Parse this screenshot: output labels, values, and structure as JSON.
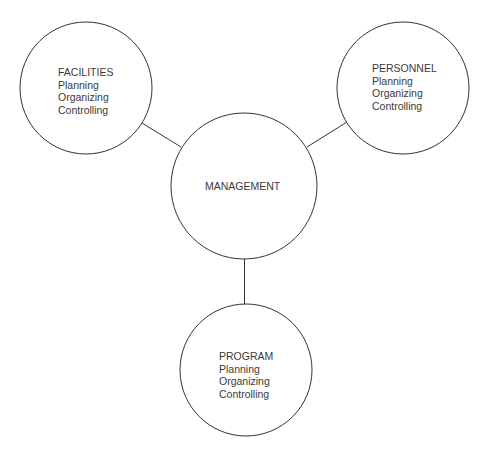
{
  "diagram": {
    "center": {
      "label": "MANAGEMENT",
      "cx": 244,
      "cy": 186,
      "r": 73
    },
    "nodes": [
      {
        "id": "facilities",
        "title": "FACILITIES",
        "items": [
          "Planning",
          "Organizing",
          "Controlling"
        ],
        "cx": 86,
        "cy": 88,
        "r": 66
      },
      {
        "id": "personnel",
        "title": "PERSONNEL",
        "items": [
          "Planning",
          "Organizing",
          "Controlling"
        ],
        "cx": 403,
        "cy": 88,
        "r": 66
      },
      {
        "id": "program",
        "title": "PROGRAM",
        "items": [
          "Planning",
          "Organizing",
          "Controlling"
        ],
        "cx": 246,
        "cy": 370,
        "r": 66
      }
    ],
    "edges": [
      {
        "from": "facilities",
        "to": "management"
      },
      {
        "from": "personnel",
        "to": "management"
      },
      {
        "from": "program",
        "to": "management"
      }
    ],
    "stroke_color": "#333333",
    "background": "#ffffff"
  }
}
